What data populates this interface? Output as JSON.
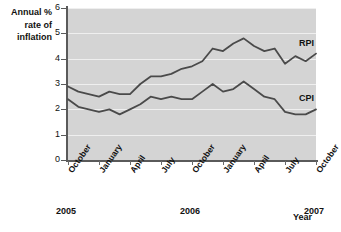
{
  "chart_data": {
    "type": "line",
    "title": "",
    "ylabel": "Annual % rate of inflation",
    "xlabel": "Year",
    "ylim": [
      0,
      6
    ],
    "yticks": [
      0,
      1,
      2,
      3,
      4,
      5,
      6
    ],
    "grid": true,
    "legend_position": "inline-right",
    "xtick_labels": [
      "October",
      "January",
      "April",
      "July",
      "October",
      "January",
      "April",
      "July",
      "October"
    ],
    "year_labels": [
      {
        "text": "2005",
        "tick_index": 0
      },
      {
        "text": "2006",
        "tick_index": 4
      },
      {
        "text": "2007",
        "tick_index": 8
      }
    ],
    "x_months": [
      "Oct 2005",
      "Nov 2005",
      "Dec 2005",
      "Jan 2006",
      "Feb 2006",
      "Mar 2006",
      "Apr 2006",
      "May 2006",
      "Jun 2006",
      "Jul 2006",
      "Aug 2006",
      "Sep 2006",
      "Oct 2006",
      "Nov 2006",
      "Dec 2006",
      "Jan 2007",
      "Feb 2007",
      "Mar 2007",
      "Apr 2007",
      "May 2007",
      "Jun 2007",
      "Jul 2007",
      "Aug 2007",
      "Sep 2007",
      "Oct 2007"
    ],
    "series": [
      {
        "name": "RPI",
        "color": "#4a4a4a",
        "values": [
          2.9,
          2.7,
          2.6,
          2.5,
          2.7,
          2.6,
          2.6,
          3.0,
          3.3,
          3.3,
          3.4,
          3.6,
          3.7,
          3.9,
          4.4,
          4.3,
          4.6,
          4.8,
          4.5,
          4.3,
          4.4,
          3.8,
          4.1,
          3.9,
          4.2
        ]
      },
      {
        "name": "CPI",
        "color": "#4a4a4a",
        "values": [
          2.4,
          2.1,
          2.0,
          1.9,
          2.0,
          1.8,
          2.0,
          2.2,
          2.5,
          2.4,
          2.5,
          2.4,
          2.4,
          2.7,
          3.0,
          2.7,
          2.8,
          3.1,
          2.8,
          2.5,
          2.4,
          1.9,
          1.8,
          1.8,
          2.0
        ]
      }
    ]
  },
  "labels": {
    "y_title_line1": "Annual %",
    "y_title_line2": "rate of",
    "y_title_line3": "inflation",
    "x_title": "Year",
    "rpi": "RPI",
    "cpi": "CPI"
  }
}
